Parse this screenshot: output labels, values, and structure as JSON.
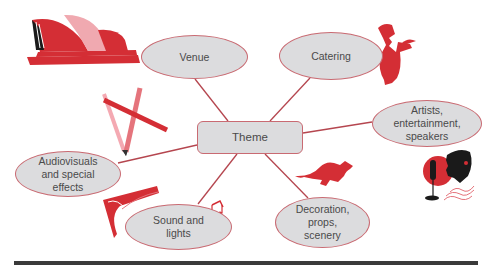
{
  "diagram": {
    "type": "mind-map",
    "center": {
      "label": "Theme"
    },
    "nodes": [
      {
        "id": "venue",
        "label": "Venue",
        "icon": "opera-house-icon"
      },
      {
        "id": "catering",
        "label": "Catering",
        "icon": "chef-icon"
      },
      {
        "id": "artists",
        "label": "Artists,\nentertainment,\nspeakers",
        "icon": "singer-microphone-icon"
      },
      {
        "id": "audiovisuals",
        "label": "Audiovisuals\nand special\neffects",
        "icon": "pencils-icon"
      },
      {
        "id": "sound",
        "label": "Sound and\nlights",
        "icon": "spotlight-icon"
      },
      {
        "id": "decoration",
        "label": "Decoration,\nprops,\nscenery",
        "icon": "kangaroo-icon"
      }
    ],
    "extra_icons": [
      "music-note-icon"
    ],
    "colors": {
      "node_fill": "#dcdcde",
      "node_border": "#c96a72",
      "connector": "#b5464f",
      "icon_red": "#d42e35",
      "icon_pink": "#f0a9b0",
      "text": "#4a4a4a",
      "rule": "#3a3a3a"
    }
  }
}
